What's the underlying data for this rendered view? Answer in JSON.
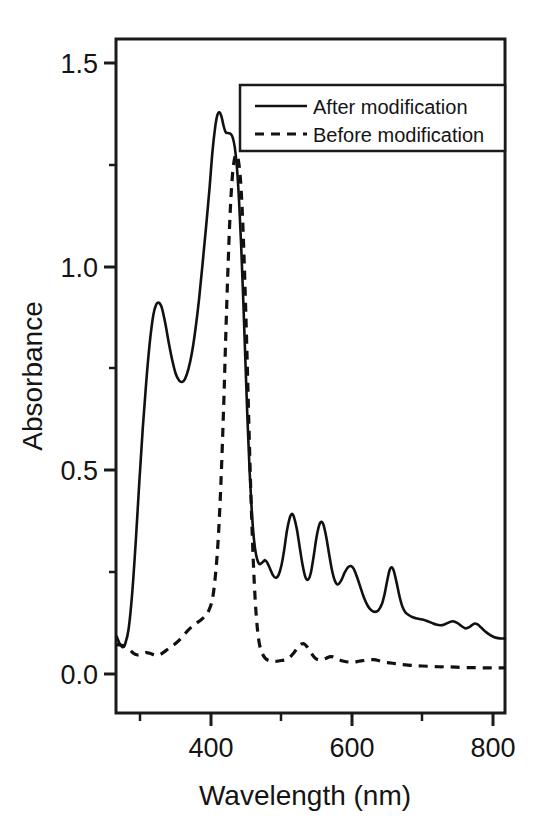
{
  "chart_data": {
    "type": "line",
    "title": "",
    "xlabel": "Wavelength (nm)",
    "ylabel": "Absorbance",
    "xlim": [
      265,
      818
    ],
    "ylim": [
      -0.09,
      1.63
    ],
    "grid": false,
    "x_ticks_major": [
      400,
      600,
      800
    ],
    "x_tick_labels": [
      "400",
      "600",
      "800"
    ],
    "x_ticks_minor": [
      300,
      500,
      700
    ],
    "y_ticks_major": [
      0.0,
      0.5,
      1.0,
      1.5
    ],
    "y_tick_labels": [
      "0.0",
      "0.5",
      "1.0",
      "1.5"
    ],
    "y_ticks_minor": [
      0.25,
      0.75,
      1.25
    ],
    "legend_position": "top-right",
    "legend_entries": [
      {
        "name": "After modification",
        "style": "solid"
      },
      {
        "name": "Before modification",
        "style": "dashed"
      }
    ],
    "series": [
      {
        "name": "After modification",
        "style": "solid",
        "points": [
          [
            266,
            0.105
          ],
          [
            270,
            0.088
          ],
          [
            274,
            0.078
          ],
          [
            278,
            0.086
          ],
          [
            283,
            0.125
          ],
          [
            288,
            0.215
          ],
          [
            293,
            0.345
          ],
          [
            298,
            0.495
          ],
          [
            303,
            0.635
          ],
          [
            308,
            0.755
          ],
          [
            313,
            0.855
          ],
          [
            318,
            0.925
          ],
          [
            322,
            0.952
          ],
          [
            326,
            0.957
          ],
          [
            330,
            0.945
          ],
          [
            335,
            0.905
          ],
          [
            340,
            0.855
          ],
          [
            345,
            0.81
          ],
          [
            350,
            0.775
          ],
          [
            355,
            0.758
          ],
          [
            359,
            0.755
          ],
          [
            363,
            0.762
          ],
          [
            368,
            0.788
          ],
          [
            373,
            0.83
          ],
          [
            378,
            0.89
          ],
          [
            383,
            0.965
          ],
          [
            388,
            1.055
          ],
          [
            393,
            1.15
          ],
          [
            398,
            1.25
          ],
          [
            402,
            1.34
          ],
          [
            406,
            1.405
          ],
          [
            409,
            1.435
          ],
          [
            412,
            1.443
          ],
          [
            415,
            1.432
          ],
          [
            418,
            1.408
          ],
          [
            421,
            1.392
          ],
          [
            424,
            1.39
          ],
          [
            428,
            1.388
          ],
          [
            431,
            1.378
          ],
          [
            434,
            1.352
          ],
          [
            437,
            1.3
          ],
          [
            440,
            1.215
          ],
          [
            443,
            1.1
          ],
          [
            446,
            0.96
          ],
          [
            449,
            0.805
          ],
          [
            452,
            0.655
          ],
          [
            455,
            0.525
          ],
          [
            458,
            0.425
          ],
          [
            461,
            0.355
          ],
          [
            464,
            0.315
          ],
          [
            467,
            0.295
          ],
          [
            470,
            0.29
          ],
          [
            474,
            0.296
          ],
          [
            477,
            0.3
          ],
          [
            480,
            0.294
          ],
          [
            484,
            0.278
          ],
          [
            488,
            0.262
          ],
          [
            492,
            0.255
          ],
          [
            496,
            0.262
          ],
          [
            500,
            0.285
          ],
          [
            504,
            0.325
          ],
          [
            508,
            0.375
          ],
          [
            512,
            0.408
          ],
          [
            515,
            0.418
          ],
          [
            518,
            0.41
          ],
          [
            522,
            0.38
          ],
          [
            526,
            0.335
          ],
          [
            530,
            0.29
          ],
          [
            534,
            0.258
          ],
          [
            538,
            0.25
          ],
          [
            542,
            0.268
          ],
          [
            546,
            0.31
          ],
          [
            550,
            0.358
          ],
          [
            554,
            0.39
          ],
          [
            557,
            0.398
          ],
          [
            560,
            0.39
          ],
          [
            564,
            0.358
          ],
          [
            568,
            0.315
          ],
          [
            572,
            0.275
          ],
          [
            576,
            0.248
          ],
          [
            580,
            0.238
          ],
          [
            585,
            0.248
          ],
          [
            590,
            0.268
          ],
          [
            595,
            0.282
          ],
          [
            599,
            0.285
          ],
          [
            603,
            0.278
          ],
          [
            608,
            0.255
          ],
          [
            613,
            0.228
          ],
          [
            618,
            0.202
          ],
          [
            623,
            0.183
          ],
          [
            628,
            0.172
          ],
          [
            633,
            0.168
          ],
          [
            638,
            0.172
          ],
          [
            643,
            0.188
          ],
          [
            647,
            0.215
          ],
          [
            651,
            0.252
          ],
          [
            654,
            0.275
          ],
          [
            657,
            0.282
          ],
          [
            660,
            0.272
          ],
          [
            664,
            0.242
          ],
          [
            668,
            0.208
          ],
          [
            672,
            0.182
          ],
          [
            676,
            0.168
          ],
          [
            681,
            0.16
          ],
          [
            686,
            0.155
          ],
          [
            691,
            0.152
          ],
          [
            696,
            0.15
          ],
          [
            702,
            0.148
          ],
          [
            708,
            0.144
          ],
          [
            714,
            0.14
          ],
          [
            720,
            0.136
          ],
          [
            726,
            0.134
          ],
          [
            732,
            0.136
          ],
          [
            738,
            0.141
          ],
          [
            744,
            0.144
          ],
          [
            750,
            0.14
          ],
          [
            756,
            0.132
          ],
          [
            762,
            0.126
          ],
          [
            768,
            0.13
          ],
          [
            774,
            0.138
          ],
          [
            779,
            0.136
          ],
          [
            784,
            0.128
          ],
          [
            790,
            0.118
          ],
          [
            796,
            0.11
          ],
          [
            802,
            0.104
          ],
          [
            808,
            0.101
          ],
          [
            814,
            0.1
          ],
          [
            818,
            0.1
          ]
        ]
      },
      {
        "name": "Before modification",
        "style": "dashed",
        "points": [
          [
            266,
            0.085
          ],
          [
            272,
            0.083
          ],
          [
            278,
            0.08
          ],
          [
            284,
            0.072
          ],
          [
            290,
            0.062
          ],
          [
            296,
            0.058
          ],
          [
            302,
            0.06
          ],
          [
            308,
            0.064
          ],
          [
            314,
            0.062
          ],
          [
            320,
            0.058
          ],
          [
            326,
            0.058
          ],
          [
            332,
            0.064
          ],
          [
            338,
            0.072
          ],
          [
            344,
            0.08
          ],
          [
            350,
            0.088
          ],
          [
            356,
            0.098
          ],
          [
            362,
            0.11
          ],
          [
            368,
            0.122
          ],
          [
            374,
            0.132
          ],
          [
            380,
            0.14
          ],
          [
            386,
            0.148
          ],
          [
            392,
            0.158
          ],
          [
            397,
            0.172
          ],
          [
            402,
            0.2
          ],
          [
            406,
            0.255
          ],
          [
            410,
            0.345
          ],
          [
            414,
            0.49
          ],
          [
            418,
            0.69
          ],
          [
            421,
            0.87
          ],
          [
            424,
            1.035
          ],
          [
            427,
            1.175
          ],
          [
            430,
            1.27
          ],
          [
            433,
            1.32
          ],
          [
            436,
            1.335
          ],
          [
            439,
            1.32
          ],
          [
            442,
            1.27
          ],
          [
            445,
            1.17
          ],
          [
            448,
            1.02
          ],
          [
            451,
            0.84
          ],
          [
            454,
            0.64
          ],
          [
            457,
            0.455
          ],
          [
            460,
            0.305
          ],
          [
            463,
            0.195
          ],
          [
            466,
            0.125
          ],
          [
            469,
            0.085
          ],
          [
            473,
            0.062
          ],
          [
            477,
            0.05
          ],
          [
            482,
            0.044
          ],
          [
            488,
            0.042
          ],
          [
            494,
            0.042
          ],
          [
            500,
            0.044
          ],
          [
            506,
            0.046
          ],
          [
            512,
            0.052
          ],
          [
            518,
            0.064
          ],
          [
            524,
            0.078
          ],
          [
            529,
            0.086
          ],
          [
            533,
            0.086
          ],
          [
            537,
            0.078
          ],
          [
            542,
            0.064
          ],
          [
            547,
            0.052
          ],
          [
            552,
            0.046
          ],
          [
            558,
            0.046
          ],
          [
            564,
            0.05
          ],
          [
            570,
            0.054
          ],
          [
            576,
            0.052
          ],
          [
            582,
            0.046
          ],
          [
            589,
            0.042
          ],
          [
            596,
            0.04
          ],
          [
            603,
            0.04
          ],
          [
            610,
            0.042
          ],
          [
            617,
            0.044
          ],
          [
            624,
            0.046
          ],
          [
            631,
            0.046
          ],
          [
            638,
            0.044
          ],
          [
            646,
            0.04
          ],
          [
            654,
            0.038
          ],
          [
            662,
            0.036
          ],
          [
            670,
            0.034
          ],
          [
            680,
            0.032
          ],
          [
            690,
            0.031
          ],
          [
            700,
            0.03
          ],
          [
            712,
            0.029
          ],
          [
            724,
            0.028
          ],
          [
            736,
            0.028
          ],
          [
            748,
            0.027
          ],
          [
            762,
            0.026
          ],
          [
            776,
            0.026
          ],
          [
            790,
            0.025
          ],
          [
            804,
            0.025
          ],
          [
            818,
            0.025
          ]
        ]
      }
    ]
  },
  "axes": {
    "y_label": "Absorbance",
    "x_label": "Wavelength (nm)",
    "y_tick_labels": [
      "1.5",
      "1.0",
      "0.5",
      "0.0"
    ],
    "x_tick_labels": [
      "400",
      "600",
      "800"
    ]
  },
  "legend": {
    "entries": [
      {
        "label": "After modification",
        "style": "solid"
      },
      {
        "label": "Before modification",
        "style": "dashed"
      }
    ]
  },
  "colors": {
    "ink": "#111111",
    "background": "#ffffff"
  }
}
